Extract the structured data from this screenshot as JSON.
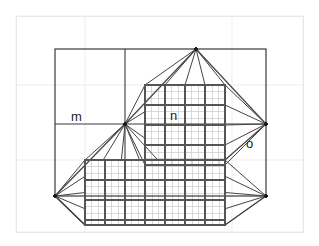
{
  "figure": {
    "background_color": "#ffffff",
    "page_border_color": "#e8e8e8",
    "background_grid_color": "#ededed",
    "mesh_fine_color": "#c9c9c9",
    "mesh_coarse_color": "#555555",
    "outline_color": "#3a3a3a",
    "fan_color": "#444444",
    "label_color": "#222222"
  },
  "labels": [
    {
      "id": "m",
      "text": "m",
      "x": 71,
      "y": 121
    },
    {
      "id": "n",
      "text": "n",
      "x": 170,
      "y": 120
    },
    {
      "id": "o",
      "text": "o",
      "x": 246,
      "y": 148
    }
  ],
  "vertices": [
    {
      "id": "apex-top",
      "name": "top-apex-node",
      "x": 196,
      "y": 49
    },
    {
      "id": "center",
      "name": "center-vanishing-node",
      "x": 125,
      "y": 124
    },
    {
      "id": "right",
      "name": "right-vanishing-node",
      "x": 266,
      "y": 124
    },
    {
      "id": "left-bottom",
      "name": "left-lower-node",
      "x": 55,
      "y": 196
    },
    {
      "id": "right-bottom",
      "name": "right-lower-node",
      "x": 266,
      "y": 196
    }
  ],
  "page_border": {
    "x": 16,
    "y": 16,
    "w": 287,
    "h": 216
  },
  "background_grid": {
    "vertical_x": [
      16,
      85,
      232,
      303
    ],
    "horizontal_y": [
      16,
      85,
      160,
      232
    ]
  },
  "main_rect": {
    "x1": 55,
    "y1": 49,
    "x2": 266,
    "y2": 196
  },
  "structural_lines": [
    {
      "name": "vertical-divider-center",
      "x1": 125,
      "y1": 49,
      "x2": 125,
      "y2": 196
    },
    {
      "name": "horizontal-divider-mid",
      "x1": 55,
      "y1": 124,
      "x2": 266,
      "y2": 124
    }
  ],
  "upper_mesh": {
    "x": 145,
    "y": 85,
    "w": 80,
    "h": 80,
    "fine_step": 6.7,
    "coarse_step": 20
  },
  "lower_mesh": {
    "x": 85,
    "y": 160,
    "w": 140,
    "h": 65,
    "fine_step": 6.7,
    "coarse_step": 20
  },
  "fan_counts": {
    "from_apex_top": 5,
    "from_center": 9,
    "from_right": 5,
    "from_left_bottom": 5,
    "from_right_bottom": 5
  }
}
